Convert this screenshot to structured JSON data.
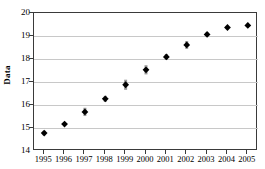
{
  "chart_data": {
    "type": "scatter",
    "title": "",
    "subtitle": "",
    "xlabel": "",
    "ylabel": "Data",
    "categories": [
      "1995",
      "1996",
      "1997",
      "1998",
      "1999",
      "2000",
      "2001",
      "2002",
      "2003",
      "2004",
      "2005"
    ],
    "x": [
      1995,
      1996,
      1997,
      1998,
      1999,
      2000,
      2001,
      2002,
      2003,
      2004,
      2005
    ],
    "values": [
      14.78,
      15.17,
      15.7,
      16.27,
      16.88,
      17.53,
      18.09,
      18.61,
      19.07,
      19.37,
      19.46
    ],
    "error_bars": [
      0.1,
      0.08,
      0.18,
      0.13,
      0.22,
      0.2,
      0.13,
      0.17,
      0.08,
      0.05,
      0.04
    ],
    "xlim": [
      1994.5,
      2005.5
    ],
    "ylim": [
      14,
      20
    ],
    "yticks": [
      "20",
      "19",
      "18",
      "17",
      "16",
      "15",
      "14"
    ],
    "ytick_values": [
      20,
      19,
      18,
      17,
      16,
      15,
      14
    ],
    "xticks": [
      "1995",
      "1996",
      "1997",
      "1998",
      "1999",
      "2000",
      "2001",
      "2002",
      "2003",
      "2004",
      "2005"
    ],
    "grid": "horizontal",
    "legend": "none",
    "marker": "diamond",
    "marker_color": "#000000",
    "errorbar_color": "#9a9a9a",
    "gridline_color": "#c8c8c8",
    "axis_color": "#3a3a3a",
    "annotations": []
  },
  "axes": {
    "y_title": "Data"
  }
}
